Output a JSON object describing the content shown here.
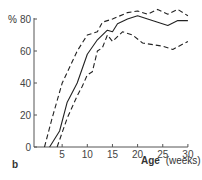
{
  "chart_data": {
    "type": "line",
    "title": "",
    "panel_label": "b",
    "xlabel_bold": "Age",
    "xlabel_rest": "(weeks)",
    "ylabel": "%",
    "xlim": [
      0,
      30
    ],
    "ylim": [
      0,
      80
    ],
    "x_ticks": [
      5,
      10,
      15,
      20,
      25,
      30
    ],
    "y_ticks": [
      0,
      20,
      40,
      60,
      80
    ],
    "grid": false,
    "legend": null,
    "series": [
      {
        "name": "upper bound",
        "style": "dashed",
        "points": [
          [
            1.5,
            0
          ],
          [
            3,
            18
          ],
          [
            5,
            40
          ],
          [
            8,
            60
          ],
          [
            10,
            70
          ],
          [
            12,
            72
          ],
          [
            13,
            78
          ],
          [
            15,
            80
          ],
          [
            18,
            84
          ],
          [
            20,
            85
          ],
          [
            22,
            83
          ],
          [
            24,
            86
          ],
          [
            26,
            83
          ],
          [
            28,
            86
          ],
          [
            30,
            82
          ]
        ]
      },
      {
        "name": "mean",
        "style": "solid",
        "points": [
          [
            2.5,
            0
          ],
          [
            4.5,
            10
          ],
          [
            6,
            28
          ],
          [
            8,
            40
          ],
          [
            10,
            58
          ],
          [
            12,
            67
          ],
          [
            14,
            73
          ],
          [
            15,
            72
          ],
          [
            16,
            77
          ],
          [
            18,
            80
          ],
          [
            20,
            82
          ],
          [
            24,
            78
          ],
          [
            26,
            76
          ],
          [
            28,
            79
          ],
          [
            30,
            79
          ]
        ]
      },
      {
        "name": "lower bound",
        "style": "dashed",
        "points": [
          [
            4,
            0
          ],
          [
            6,
            18
          ],
          [
            8,
            32
          ],
          [
            9,
            38
          ],
          [
            10,
            45
          ],
          [
            11,
            47
          ],
          [
            12,
            60
          ],
          [
            13,
            62
          ],
          [
            14,
            70
          ],
          [
            15,
            66
          ],
          [
            17,
            72
          ],
          [
            19,
            70
          ],
          [
            21,
            65
          ],
          [
            25,
            63
          ],
          [
            27,
            61
          ],
          [
            30,
            66
          ]
        ]
      }
    ]
  }
}
